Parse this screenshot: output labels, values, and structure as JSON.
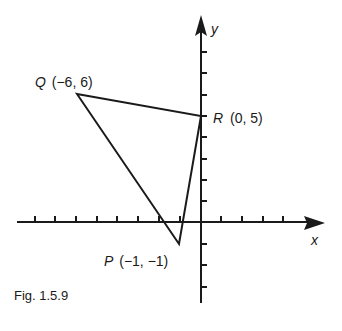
{
  "figure": {
    "caption": "Fig. 1.5.9",
    "axes": {
      "x_label": "x",
      "y_label": "y",
      "x_ticks": [
        -8,
        -7,
        -6,
        -5,
        -4,
        -3,
        -2,
        -1,
        1,
        2,
        3,
        4
      ],
      "y_ticks": [
        -3,
        -2,
        -1,
        1,
        2,
        3,
        4,
        5,
        6,
        7,
        8
      ]
    },
    "points": [
      {
        "name": "Q",
        "coords": "(−6, 6)",
        "x": -6,
        "y": 6
      },
      {
        "name": "R",
        "coords": "(0, 5)",
        "x": 0,
        "y": 5
      },
      {
        "name": "P",
        "coords": "(−1, −1)",
        "x": -1,
        "y": -1
      }
    ],
    "shape": "triangle PQR",
    "colors": {
      "ink": "#1a1a1a",
      "background": "#ffffff"
    }
  }
}
